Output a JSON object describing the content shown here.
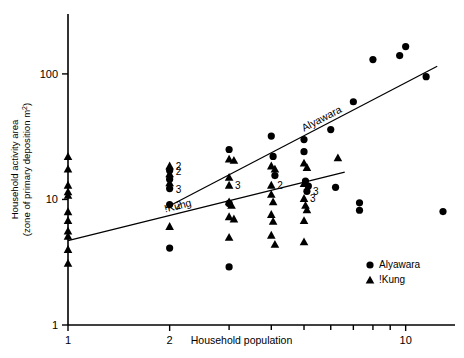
{
  "chart_data": {
    "type": "scatter",
    "title": "",
    "xlabel": "Household population",
    "ylabel": "Household activity area (zone of primary deposition m2)",
    "ylabel_line1": "Household activity area",
    "ylabel_line2": "(zone of primary deposition m",
    "ylabel_exponent": "2",
    "ylabel_close": ")",
    "xscale": "log",
    "yscale": "log",
    "xlim": [
      1,
      14
    ],
    "ylim": [
      1,
      300
    ],
    "xticks": [
      1,
      2,
      10
    ],
    "xticklabels": [
      "1",
      "2",
      "10"
    ],
    "yticks": [
      1,
      10,
      100
    ],
    "yticklabels": [
      "1",
      "10",
      "100"
    ],
    "grid": false,
    "legend_position": "bottom-right",
    "legend": [
      {
        "label": "Alyawara",
        "marker": "circle"
      },
      {
        "label": "!Kung",
        "marker": "triangle"
      }
    ],
    "series": [
      {
        "name": "Alyawara",
        "marker": "circle",
        "points": [
          {
            "x": 2.0,
            "y": 17.0,
            "count": "2"
          },
          {
            "x": 2.0,
            "y": 14.5
          },
          {
            "x": 2.0,
            "y": 12.2,
            "count": "3"
          },
          {
            "x": 2.0,
            "y": 9.1,
            "count": "2"
          },
          {
            "x": 2.0,
            "y": 4.1
          },
          {
            "x": 3.0,
            "y": 25.0
          },
          {
            "x": 3.0,
            "y": 9.3
          },
          {
            "x": 3.0,
            "y": 2.9
          },
          {
            "x": 4.0,
            "y": 32.0
          },
          {
            "x": 4.05,
            "y": 22.0
          },
          {
            "x": 4.1,
            "y": 15.5
          },
          {
            "x": 5.0,
            "y": 30.0
          },
          {
            "x": 5.0,
            "y": 24.0
          },
          {
            "x": 5.05,
            "y": 14.0
          },
          {
            "x": 5.1,
            "y": 11.6,
            "count": "3"
          },
          {
            "x": 5.15,
            "y": 12.8
          },
          {
            "x": 6.0,
            "y": 36.0
          },
          {
            "x": 6.2,
            "y": 12.5
          },
          {
            "x": 7.0,
            "y": 60.0
          },
          {
            "x": 7.3,
            "y": 9.4
          },
          {
            "x": 7.3,
            "y": 8.2
          },
          {
            "x": 8.0,
            "y": 130.0
          },
          {
            "x": 9.6,
            "y": 140.0
          },
          {
            "x": 10.0,
            "y": 165.0
          },
          {
            "x": 11.5,
            "y": 95.0
          },
          {
            "x": 12.9,
            "y": 8.0
          }
        ]
      },
      {
        "name": "!Kung",
        "marker": "triangle",
        "points": [
          {
            "x": 1.0,
            "y": 22.0
          },
          {
            "x": 1.0,
            "y": 17.5
          },
          {
            "x": 1.0,
            "y": 13.0
          },
          {
            "x": 1.0,
            "y": 11.5
          },
          {
            "x": 1.0,
            "y": 10.8
          },
          {
            "x": 1.0,
            "y": 8.0
          },
          {
            "x": 1.0,
            "y": 6.8
          },
          {
            "x": 1.0,
            "y": 5.6
          },
          {
            "x": 1.0,
            "y": 5.1
          },
          {
            "x": 1.0,
            "y": 4.0
          },
          {
            "x": 1.0,
            "y": 3.1
          },
          {
            "x": 2.0,
            "y": 18.5,
            "count": "2"
          },
          {
            "x": 2.0,
            "y": 16.0
          },
          {
            "x": 2.0,
            "y": 13.6
          },
          {
            "x": 2.0,
            "y": 6.1
          },
          {
            "x": 3.0,
            "y": 21.0
          },
          {
            "x": 3.1,
            "y": 20.5
          },
          {
            "x": 3.0,
            "y": 15.0
          },
          {
            "x": 3.0,
            "y": 13.0,
            "count": "3"
          },
          {
            "x": 3.0,
            "y": 9.6
          },
          {
            "x": 3.05,
            "y": 9.0
          },
          {
            "x": 3.0,
            "y": 7.3
          },
          {
            "x": 3.1,
            "y": 7.0
          },
          {
            "x": 3.0,
            "y": 5.0
          },
          {
            "x": 4.0,
            "y": 18.5
          },
          {
            "x": 4.1,
            "y": 17.5
          },
          {
            "x": 4.0,
            "y": 13.0,
            "count": "2"
          },
          {
            "x": 4.0,
            "y": 11.0
          },
          {
            "x": 4.05,
            "y": 9.6
          },
          {
            "x": 4.0,
            "y": 7.6
          },
          {
            "x": 4.05,
            "y": 6.7
          },
          {
            "x": 4.0,
            "y": 5.2
          },
          {
            "x": 4.1,
            "y": 4.4
          },
          {
            "x": 5.0,
            "y": 19.5
          },
          {
            "x": 5.1,
            "y": 18.0
          },
          {
            "x": 5.0,
            "y": 13.4
          },
          {
            "x": 5.0,
            "y": 10.2,
            "count": "3"
          },
          {
            "x": 5.05,
            "y": 9.0
          },
          {
            "x": 5.1,
            "y": 8.3
          },
          {
            "x": 5.0,
            "y": 6.8
          },
          {
            "x": 5.0,
            "y": 4.6
          },
          {
            "x": 6.3,
            "y": 21.5
          }
        ]
      }
    ],
    "fits": [
      {
        "name": "Alyawara",
        "label": "Alyawara",
        "x1": 1.95,
        "y1": 8.6,
        "x2": 12.4,
        "y2": 115.0
      },
      {
        "name": "!Kung",
        "label": "!Kung",
        "x1": 1.0,
        "y1": 4.7,
        "x2": 6.6,
        "y2": 16.5
      }
    ]
  }
}
